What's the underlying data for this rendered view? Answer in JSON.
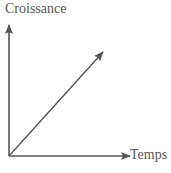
{
  "diagram": {
    "y_axis_label": "Croissance",
    "x_axis_label": "Temps",
    "line": {
      "type": "linear-increase",
      "from": [
        0,
        0
      ],
      "to": [
        1,
        1
      ]
    },
    "colors": {
      "axis": "#555555",
      "text": "#555555"
    }
  }
}
